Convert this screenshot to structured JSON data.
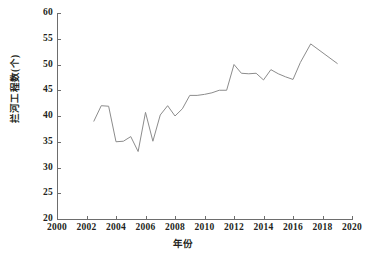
{
  "chart_data": {
    "type": "line",
    "title": "",
    "xlabel": "年份",
    "ylabel": "拦河工程数(个)",
    "xlim": [
      2000,
      2020
    ],
    "ylim": [
      20,
      60
    ],
    "xticks": [
      2000,
      2002,
      2004,
      2006,
      2008,
      2010,
      2012,
      2014,
      2016,
      2018,
      2020
    ],
    "yticks": [
      20,
      25,
      30,
      35,
      40,
      45,
      50,
      55,
      60
    ],
    "grid": false,
    "legend": null,
    "line_color": "#8c8c8c",
    "series": [
      {
        "name": "拦河工程数",
        "x": [
          2002.5,
          2003.0,
          2003.5,
          2004.0,
          2004.5,
          2005.0,
          2005.5,
          2006.0,
          2006.5,
          2007.0,
          2007.5,
          2008.0,
          2008.5,
          2009.0,
          2009.5,
          2010.0,
          2010.5,
          2011.0,
          2011.5,
          2012.0,
          2012.5,
          2013.0,
          2013.5,
          2014.0,
          2014.5,
          2015.0,
          2015.5,
          2016.0,
          2016.5,
          2017.2,
          2019.0
        ],
        "values": [
          39.0,
          42.0,
          41.9,
          35.0,
          35.1,
          36.0,
          33.1,
          40.7,
          35.1,
          40.2,
          42.0,
          40.0,
          41.4,
          44.0,
          44.0,
          44.2,
          44.5,
          45.0,
          45.0,
          50.0,
          48.3,
          48.2,
          48.3,
          47.0,
          49.0,
          48.2,
          47.6,
          47.1,
          50.4,
          54.0,
          50.2
        ]
      }
    ]
  },
  "axes": {
    "y_tick_labels": [
      "60",
      "55",
      "50",
      "45",
      "40",
      "35",
      "30",
      "25",
      "20"
    ],
    "x_tick_labels": [
      "2000",
      "2002",
      "2004",
      "2006",
      "2008",
      "2010",
      "2012",
      "2014",
      "2016",
      "2018",
      "2020"
    ]
  }
}
